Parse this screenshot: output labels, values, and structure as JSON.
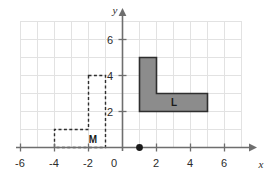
{
  "figure": {
    "type": "coordinate-grid-diagram",
    "background_color": "#ffffff",
    "grid_color": "#e2e2e2",
    "axis_color": "#6e6e6e"
  },
  "axes": {
    "x": {
      "name": "x",
      "min": -6,
      "max": 6,
      "tick_labels": [
        "-6",
        "-4",
        "-2",
        "0",
        "2",
        "4",
        "6"
      ],
      "tick_values": [
        -6,
        -4,
        -2,
        0,
        2,
        4,
        6
      ],
      "minor_step": 1
    },
    "y": {
      "name": "y",
      "min": 0,
      "max": 7,
      "tick_labels": [
        "2",
        "4",
        "6"
      ],
      "tick_values": [
        2,
        4,
        6
      ],
      "minor_step": 1
    },
    "origin_label": "0"
  },
  "shapes": [
    {
      "id": "shape-L",
      "label": "L",
      "style": "filled",
      "fill_color": "#8c8c8c",
      "stroke_color": "#2e2e2e",
      "stroke_style": "solid",
      "label_position": {
        "x": 3,
        "y": 2.5
      },
      "vertices": [
        {
          "x": 1,
          "y": 5
        },
        {
          "x": 2,
          "y": 5
        },
        {
          "x": 2,
          "y": 3
        },
        {
          "x": 5,
          "y": 3
        },
        {
          "x": 5,
          "y": 2
        },
        {
          "x": 1,
          "y": 2
        }
      ]
    },
    {
      "id": "shape-M",
      "label": "M",
      "style": "dashed-outline",
      "fill_color": "none",
      "stroke_color": "#2e2e2e",
      "stroke_style": "dashed",
      "label_position": {
        "x": -1.6,
        "y": 0.5
      },
      "vertices": [
        {
          "x": -2,
          "y": 4
        },
        {
          "x": -1,
          "y": 4
        },
        {
          "x": -1,
          "y": 0
        },
        {
          "x": -4,
          "y": 0
        },
        {
          "x": -4,
          "y": 1
        },
        {
          "x": -2,
          "y": 1
        }
      ]
    }
  ],
  "points": [
    {
      "id": "center-of-rotation",
      "x": 1,
      "y": 0,
      "color": "#1a1a1a",
      "radius": 3.2
    }
  ]
}
